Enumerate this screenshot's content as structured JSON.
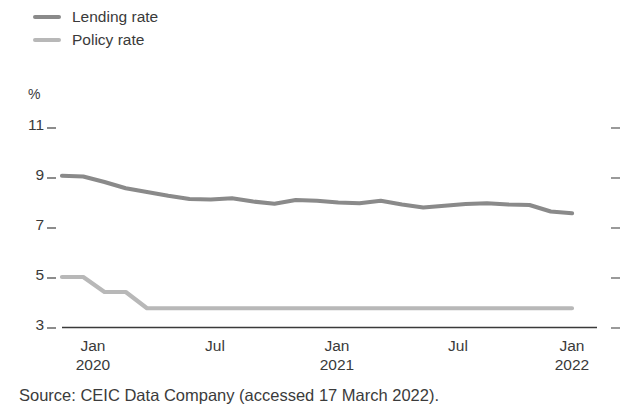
{
  "chart_data": {
    "type": "line",
    "title": "",
    "subtitle": "",
    "xlabel": "",
    "ylabel": "%",
    "ylim": [
      3,
      11
    ],
    "yticks": [
      3,
      5,
      7,
      9,
      11
    ],
    "ytick_labels": [
      "3",
      "5",
      "7",
      "9",
      "11"
    ],
    "xtick_labels": [
      {
        "month": "Jan",
        "year": "2020"
      },
      {
        "month": "Jul",
        "year": ""
      },
      {
        "month": "Jan",
        "year": "2021"
      },
      {
        "month": "Jul",
        "year": ""
      },
      {
        "month": "Jan",
        "year": "2022"
      }
    ],
    "x": [
      "2020-01",
      "2020-02",
      "2020-03",
      "2020-04",
      "2020-05",
      "2020-06",
      "2020-07",
      "2020-08",
      "2020-09",
      "2020-10",
      "2020-11",
      "2020-12",
      "2021-01",
      "2021-02",
      "2021-03",
      "2021-04",
      "2021-05",
      "2021-06",
      "2021-07",
      "2021-08",
      "2021-09",
      "2021-10",
      "2021-11",
      "2021-12",
      "2022-01"
    ],
    "grid": false,
    "legend_position": "top-left",
    "series": [
      {
        "name": "Lending rate",
        "color": "#8a8a8a",
        "values": [
          9.05,
          9.02,
          8.8,
          8.55,
          8.4,
          8.25,
          8.12,
          8.1,
          8.15,
          8.02,
          7.93,
          8.08,
          8.05,
          7.98,
          7.95,
          8.05,
          7.9,
          7.78,
          7.85,
          7.92,
          7.95,
          7.9,
          7.88,
          7.62,
          7.55
        ]
      },
      {
        "name": "Policy rate",
        "color": "#b8b8b8",
        "values": [
          5.0,
          5.0,
          4.4,
          4.4,
          3.75,
          3.75,
          3.75,
          3.75,
          3.75,
          3.75,
          3.75,
          3.75,
          3.75,
          3.75,
          3.75,
          3.75,
          3.75,
          3.75,
          3.75,
          3.75,
          3.75,
          3.75,
          3.75,
          3.75,
          3.75
        ]
      }
    ]
  },
  "legend": {
    "items": [
      {
        "label": "Lending rate",
        "color": "#8a8a8a"
      },
      {
        "label": "Policy rate",
        "color": "#b8b8b8"
      }
    ]
  },
  "axes": {
    "unit_label": "%",
    "y_ticks": [
      "11",
      "9",
      "7",
      "5",
      "3"
    ],
    "x_ticks": [
      {
        "month": "Jan",
        "year": "2020"
      },
      {
        "month": "Jul",
        "year": ""
      },
      {
        "month": "Jan",
        "year": "2021"
      },
      {
        "month": "Jul",
        "year": ""
      },
      {
        "month": "Jan",
        "year": "2022"
      }
    ]
  },
  "source": {
    "text": "Source: CEIC Data Company (accessed 17 March 2022)."
  }
}
